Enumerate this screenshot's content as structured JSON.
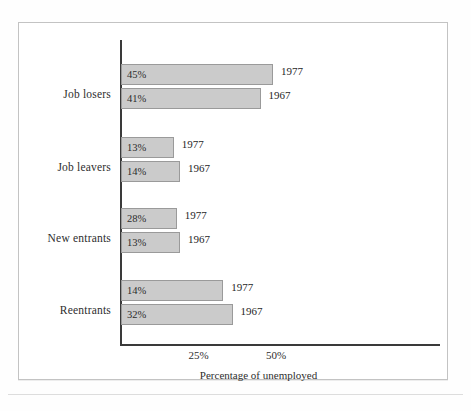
{
  "chart_data": {
    "type": "bar",
    "orientation": "horizontal",
    "title": "",
    "xlabel": "Percentage of unemployed",
    "ylabel": "",
    "xlim": [
      0,
      57
    ],
    "xticks": [
      25,
      50
    ],
    "xtick_labels": [
      "25%",
      "50%"
    ],
    "grid": false,
    "legend": "inline-year-labels",
    "categories": [
      "Job losers",
      "Job leavers",
      "New entrants",
      "Reentrants"
    ],
    "series": [
      {
        "name": "1977",
        "values": [
          45,
          13,
          28,
          14
        ]
      },
      {
        "name": "1967",
        "values": [
          41,
          14,
          13,
          32
        ]
      }
    ],
    "bars": [
      {
        "category": "Job losers",
        "year": "1977",
        "value": 45,
        "value_label": "45%",
        "drawn_percent": 49,
        "top": 64
      },
      {
        "category": "Job losers",
        "year": "1967",
        "value": 41,
        "value_label": "41%",
        "drawn_percent": 45,
        "top": 88
      },
      {
        "category": "Job leavers",
        "year": "1977",
        "value": 13,
        "value_label": "13%",
        "drawn_percent": 17,
        "top": 137
      },
      {
        "category": "Job leavers",
        "year": "1967",
        "value": 14,
        "value_label": "14%",
        "drawn_percent": 19,
        "top": 161
      },
      {
        "category": "New entrants",
        "year": "1977",
        "value": 28,
        "value_label": "28%",
        "drawn_percent": 18,
        "top": 208
      },
      {
        "category": "New entrants",
        "year": "1967",
        "value": 13,
        "value_label": "13%",
        "drawn_percent": 19,
        "top": 232
      },
      {
        "category": "Reentrants",
        "year": "1977",
        "value": 14,
        "value_label": "14%",
        "drawn_percent": 33,
        "top": 280
      },
      {
        "category": "Reentrants",
        "year": "1967",
        "value": 32,
        "value_label": "32%",
        "drawn_percent": 36,
        "top": 304
      }
    ],
    "category_label_tops": [
      88,
      161,
      232,
      304
    ],
    "colors": {
      "bar_fill": "#cbcbcb",
      "bar_border": "#9a9a9a",
      "axis": "#3a3a3a",
      "text": "#2e2e2e",
      "frame": "#c3c3c3",
      "background": "#ffffff"
    }
  }
}
